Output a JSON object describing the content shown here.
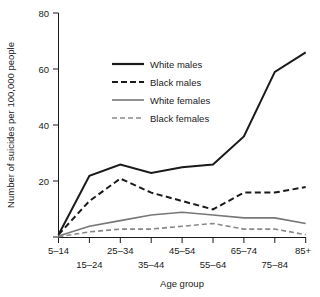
{
  "chart_data": {
    "type": "line",
    "title": "",
    "xlabel": "Age group",
    "ylabel": "Number of suicides per 100,000 people",
    "categories": [
      "5-14",
      "15-24",
      "25-34",
      "35-44",
      "45-54",
      "55-64",
      "65-74",
      "75-84",
      "85+"
    ],
    "xtick_labels": [
      "5–14",
      "15–24",
      "25–34",
      "35–44",
      "45–54",
      "55–64",
      "65–74",
      "75–84",
      "85+"
    ],
    "ytick_labels": [
      "0",
      "20",
      "40",
      "60",
      "80"
    ],
    "ytick_values": [
      0,
      20,
      40,
      60,
      80
    ],
    "ylim": [
      0,
      80
    ],
    "grid": false,
    "legend_position": "upper-left-inside",
    "series": [
      {
        "name": "White males",
        "values": [
          1,
          22,
          26,
          23,
          25,
          26,
          36,
          59,
          66
        ],
        "color": "#1a1a1a",
        "style": "solid",
        "width": 2.0
      },
      {
        "name": "Black males",
        "values": [
          1,
          13,
          21,
          16,
          13,
          10,
          16,
          16,
          18
        ],
        "color": "#1a1a1a",
        "style": "dashed",
        "width": 2.0
      },
      {
        "name": "White females",
        "values": [
          0.5,
          4,
          6,
          8,
          9,
          8,
          7,
          7,
          5
        ],
        "color": "#777777",
        "style": "solid",
        "width": 1.6
      },
      {
        "name": "Black females",
        "values": [
          0.3,
          2,
          3,
          3,
          4,
          5,
          3,
          3,
          1
        ],
        "color": "#888888",
        "style": "dashed",
        "width": 1.6
      }
    ]
  },
  "legend": {
    "items": [
      {
        "label": "White males"
      },
      {
        "label": "Black males"
      },
      {
        "label": "White females"
      },
      {
        "label": "Black females"
      }
    ]
  },
  "axes": {
    "y_title": "Number of suicides per 100,000 people",
    "x_title": "Age group"
  }
}
